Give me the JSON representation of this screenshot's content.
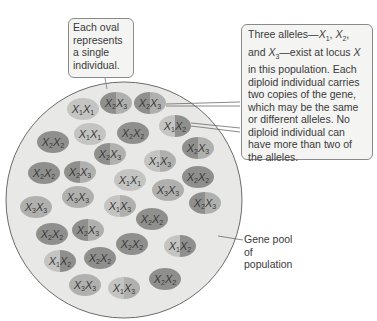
{
  "callouts": {
    "oval_note": "Each oval represents a single individual.",
    "alleles_note_html": "Three alleles—X1, X2, and X3—exist at locus X in this population. Each diploid individual carries two copies of the gene, which may be the same or different alleles. No diploid individual can have more than two of the alleles."
  },
  "labels": {
    "gene_pool": "Gene pool of population"
  },
  "colors": {
    "pool_fill": "#e6e6e4",
    "pool_stroke": "#6b6b6b",
    "allele_X1": "#c4c4c2",
    "allele_X2": "#8f8f8d",
    "allele_X3": "#b0b0ae"
  },
  "individuals": [
    {
      "genotype": "X1X1",
      "a": 1,
      "b": 1,
      "x": 83,
      "y": 109
    },
    {
      "genotype": "X2X3",
      "a": 2,
      "b": 3,
      "x": 116,
      "y": 103
    },
    {
      "genotype": "X2X3",
      "a": 2,
      "b": 3,
      "x": 150,
      "y": 103
    },
    {
      "genotype": "X1X2",
      "a": 1,
      "b": 2,
      "x": 175,
      "y": 126
    },
    {
      "genotype": "X2X2",
      "a": 2,
      "b": 2,
      "x": 53,
      "y": 142
    },
    {
      "genotype": "X1X1",
      "a": 1,
      "b": 1,
      "x": 90,
      "y": 134
    },
    {
      "genotype": "X2X2",
      "a": 2,
      "b": 2,
      "x": 133,
      "y": 133
    },
    {
      "genotype": "X2X3",
      "a": 2,
      "b": 3,
      "x": 110,
      "y": 154
    },
    {
      "genotype": "X2X3",
      "a": 2,
      "b": 3,
      "x": 198,
      "y": 148
    },
    {
      "genotype": "X1X3",
      "a": 1,
      "b": 3,
      "x": 160,
      "y": 161
    },
    {
      "genotype": "X2X2",
      "a": 2,
      "b": 2,
      "x": 198,
      "y": 177
    },
    {
      "genotype": "X2X2",
      "a": 2,
      "b": 2,
      "x": 44,
      "y": 173
    },
    {
      "genotype": "X2X3",
      "a": 2,
      "b": 3,
      "x": 80,
      "y": 172
    },
    {
      "genotype": "X1X1",
      "a": 1,
      "b": 1,
      "x": 130,
      "y": 180
    },
    {
      "genotype": "X3X3",
      "a": 3,
      "b": 3,
      "x": 168,
      "y": 190
    },
    {
      "genotype": "X3X3",
      "a": 3,
      "b": 3,
      "x": 36,
      "y": 207
    },
    {
      "genotype": "X3X3",
      "a": 3,
      "b": 3,
      "x": 78,
      "y": 197
    },
    {
      "genotype": "X1X3",
      "a": 1,
      "b": 3,
      "x": 120,
      "y": 206
    },
    {
      "genotype": "X2X2",
      "a": 2,
      "b": 2,
      "x": 152,
      "y": 219
    },
    {
      "genotype": "X2X3",
      "a": 2,
      "b": 3,
      "x": 205,
      "y": 203
    },
    {
      "genotype": "X2X2",
      "a": 2,
      "b": 2,
      "x": 52,
      "y": 234
    },
    {
      "genotype": "X2X3",
      "a": 2,
      "b": 3,
      "x": 88,
      "y": 230
    },
    {
      "genotype": "X2X2",
      "a": 2,
      "b": 2,
      "x": 132,
      "y": 244
    },
    {
      "genotype": "X1X2",
      "a": 1,
      "b": 2,
      "x": 180,
      "y": 246
    },
    {
      "genotype": "X1X2",
      "a": 1,
      "b": 2,
      "x": 60,
      "y": 261
    },
    {
      "genotype": "X2X2",
      "a": 2,
      "b": 2,
      "x": 100,
      "y": 258
    },
    {
      "genotype": "X3X3",
      "a": 3,
      "b": 3,
      "x": 85,
      "y": 285
    },
    {
      "genotype": "X1X3",
      "a": 1,
      "b": 3,
      "x": 124,
      "y": 288
    },
    {
      "genotype": "X2X2",
      "a": 2,
      "b": 2,
      "x": 165,
      "y": 279
    }
  ]
}
